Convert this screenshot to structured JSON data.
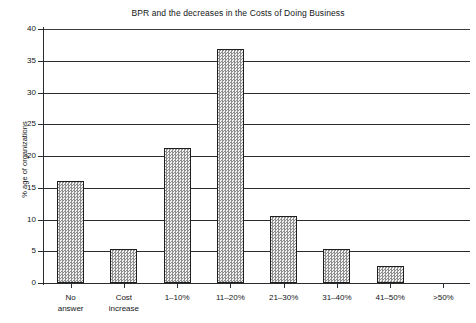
{
  "chart_data": {
    "type": "bar",
    "title": "BPR and the decreases in the Costs of Doing Business",
    "xlabel": "",
    "ylabel": "% age of organizations",
    "ylim": [
      0,
      40
    ],
    "yticks": [
      0,
      5,
      10,
      15,
      20,
      25,
      30,
      35,
      40
    ],
    "grid": true,
    "legend": false,
    "categories": [
      "No answer",
      "Cost increase",
      "1–10%",
      "11–20%",
      "21–30%",
      "31–40%",
      "41–50%",
      ">50%"
    ],
    "category_lines": [
      [
        "No",
        "answer"
      ],
      [
        "Cost",
        "increase"
      ],
      [
        "1–10%",
        ""
      ],
      [
        "11–20%",
        ""
      ],
      [
        "21–30%",
        ""
      ],
      [
        "31–40%",
        ""
      ],
      [
        "41–50%",
        ""
      ],
      [
        ">50%",
        ""
      ]
    ],
    "values": [
      16.0,
      5.3,
      21.2,
      36.8,
      10.6,
      5.3,
      2.7,
      0
    ],
    "bar_fill": "#d8d8d8",
    "bar_edge": "#1d1f21",
    "axis_color": "#2a2d30"
  },
  "ylabels": [
    "40",
    "35",
    "30",
    "25",
    "20",
    "15",
    "10",
    "5",
    "0"
  ]
}
